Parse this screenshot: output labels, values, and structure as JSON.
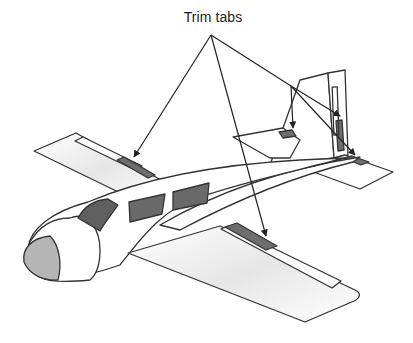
{
  "diagram": {
    "title_label": "Trim tabs",
    "callouts": [
      {
        "target": "left-wing-aileron-trim-tab"
      },
      {
        "target": "right-wing-aileron-trim-tab"
      },
      {
        "target": "left-elevator-trim-tab"
      },
      {
        "target": "rudder-trim-tab"
      },
      {
        "target": "right-elevator-trim-tab"
      }
    ],
    "colors": {
      "outline": "#333333",
      "tab_fill": "#6e6e6e",
      "window_fill": "#6a6a6a",
      "cockpit_fill": "#5f5f5f",
      "nose_fill": "#b5b5b5",
      "body_fill": "#ffffff",
      "arrow": "#222222"
    }
  }
}
